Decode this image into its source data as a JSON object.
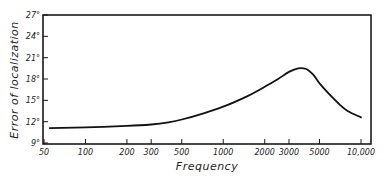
{
  "chart_data": {
    "type": "line",
    "title": "",
    "xlabel": "Frequency",
    "ylabel": "Error of localization",
    "x_scale": "log",
    "xlim": [
      50,
      10000
    ],
    "ylim": [
      9,
      27
    ],
    "x_ticks": [
      50,
      100,
      200,
      300,
      500,
      1000,
      2000,
      3000,
      5000,
      10000
    ],
    "x_tick_labels": [
      "50",
      "100",
      "200",
      "300",
      "500",
      "1000",
      "2000",
      "3000",
      "5000",
      "10,000"
    ],
    "y_ticks": [
      9,
      12,
      15,
      18,
      21,
      24,
      27
    ],
    "y_tick_labels": [
      "9°",
      "12°",
      "15°",
      "18°",
      "21°",
      "24°",
      "27°"
    ],
    "grid": false,
    "legend": null,
    "series": [
      {
        "name": "Error of localization",
        "x": [
          55,
          100,
          200,
          300,
          400,
          500,
          700,
          1000,
          1500,
          2000,
          2500,
          3000,
          3500,
          4000,
          4500,
          5000,
          6000,
          7000,
          8000,
          10000
        ],
        "values": [
          11.1,
          11.2,
          11.4,
          11.6,
          11.9,
          12.3,
          13.1,
          14.1,
          15.6,
          16.9,
          18.0,
          19.0,
          19.5,
          19.4,
          18.6,
          17.4,
          15.7,
          14.4,
          13.5,
          12.6
        ]
      }
    ]
  }
}
